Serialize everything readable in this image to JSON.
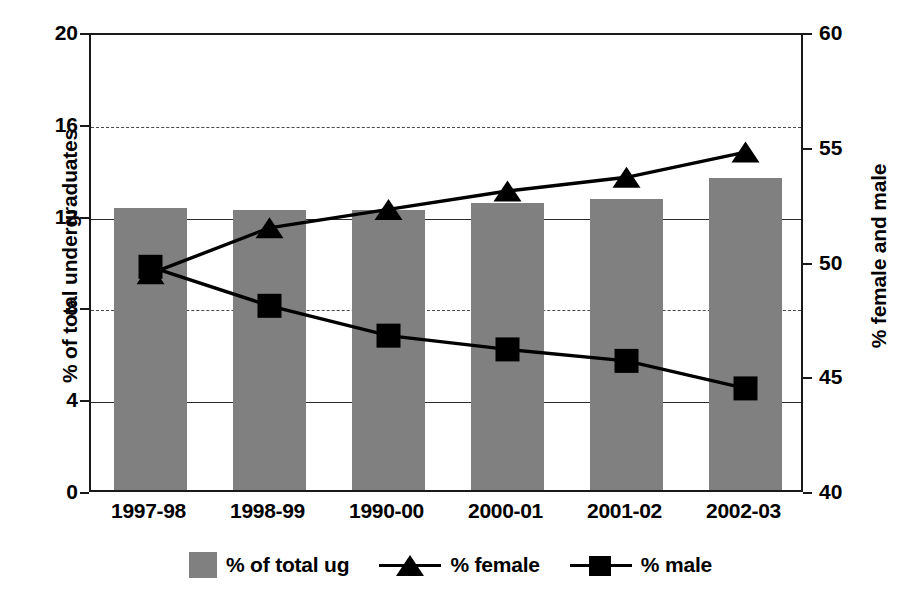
{
  "chart_data": {
    "type": "bar",
    "title": "",
    "subtitle": "",
    "categories": [
      "1997-98",
      "1998-99",
      "1990-00",
      "2000-01",
      "2001-02",
      "2002-03"
    ],
    "xlabel": "",
    "ylabel": "% of total undergraduates",
    "y2label": "% female and male",
    "ylim": [
      0,
      20
    ],
    "y2lim": [
      40,
      60
    ],
    "yticks": [
      "0",
      "4",
      "8",
      "12",
      "16",
      "20"
    ],
    "ytick_values": [
      0,
      4,
      8,
      12,
      16,
      20
    ],
    "y2ticks": [
      "40",
      "45",
      "50",
      "55",
      "60"
    ],
    "y2tick_values": [
      40,
      45,
      50,
      55,
      60
    ],
    "grid": true,
    "legend_position": "bottom",
    "series": [
      {
        "name": "% of total ug",
        "label": "% of total ug",
        "kind": "bar",
        "axis": "left",
        "color": "#808080",
        "values": [
          12.3,
          12.2,
          12.2,
          12.5,
          12.7,
          13.6
        ]
      },
      {
        "name": "% female",
        "label": "% female",
        "kind": "line",
        "marker": "triangle",
        "axis": "right",
        "color": "#000000",
        "values": [
          49.6,
          51.6,
          52.4,
          53.2,
          53.8,
          54.9
        ]
      },
      {
        "name": "% male",
        "label": "% male",
        "kind": "line",
        "marker": "square",
        "axis": "right",
        "color": "#000000",
        "values": [
          49.9,
          48.2,
          46.9,
          46.3,
          45.8,
          44.6
        ]
      }
    ]
  },
  "axes": {
    "left_title": "% of total undergraduates",
    "right_title": "% female and male"
  },
  "legend": {
    "items": [
      {
        "label": "% of total ug",
        "icon": "gray-square-swatch"
      },
      {
        "label": "% female",
        "icon": "triangle-marker-swatch"
      },
      {
        "label": "% male",
        "icon": "square-marker-swatch"
      }
    ]
  },
  "colors": {
    "bar_fill": "#808080",
    "line": "#000000",
    "frame": "#1a1a1a",
    "grid": "#2b2b2b",
    "background": "#ffffff"
  }
}
